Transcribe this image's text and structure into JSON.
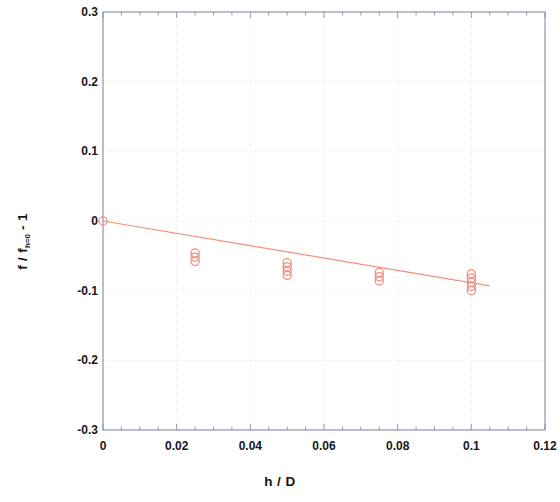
{
  "chart_data": {
    "type": "scatter",
    "title": "",
    "xlabel": "h / D",
    "ylabel_main": "f / f",
    "ylabel_sub": "h=0",
    "ylabel_tail": " - 1",
    "xlim": [
      0,
      0.12
    ],
    "ylim": [
      -0.3,
      0.3
    ],
    "xticks": [
      "0",
      "0.02",
      "0.04",
      "0.06",
      "0.08",
      "0.1",
      "0.12"
    ],
    "xtick_values": [
      0,
      0.02,
      0.04,
      0.06,
      0.08,
      0.1,
      0.12
    ],
    "yticks": [
      "0.3",
      "0.2",
      "0.1",
      "0",
      "-0.1",
      "-0.2",
      "-0.3"
    ],
    "ytick_values": [
      0.3,
      0.2,
      0.1,
      0,
      -0.1,
      -0.2,
      -0.3
    ],
    "x_minor_per_major": 4,
    "y_minor_per_major": 4,
    "grid": true,
    "grid_style": "dotted",
    "grid_color": "#e2e2ea",
    "axis_color": "#8a8ab0",
    "marker": "open-circle",
    "marker_color": "#f0907e",
    "line_color": "#f0907e",
    "legend": "none",
    "series": [
      {
        "name": "measured data",
        "type": "scatter",
        "marker": "open-circle",
        "points": [
          {
            "x": 0.0,
            "y": 0.0
          },
          {
            "x": 0.025,
            "y": -0.046
          },
          {
            "x": 0.025,
            "y": -0.052
          },
          {
            "x": 0.025,
            "y": -0.058
          },
          {
            "x": 0.05,
            "y": -0.06
          },
          {
            "x": 0.05,
            "y": -0.066
          },
          {
            "x": 0.05,
            "y": -0.072
          },
          {
            "x": 0.05,
            "y": -0.078
          },
          {
            "x": 0.075,
            "y": -0.074
          },
          {
            "x": 0.075,
            "y": -0.08
          },
          {
            "x": 0.075,
            "y": -0.086
          },
          {
            "x": 0.1,
            "y": -0.076
          },
          {
            "x": 0.1,
            "y": -0.082
          },
          {
            "x": 0.1,
            "y": -0.088
          },
          {
            "x": 0.1,
            "y": -0.094
          },
          {
            "x": 0.1,
            "y": -0.1
          }
        ]
      },
      {
        "name": "fit line",
        "type": "line",
        "points": [
          {
            "x": 0.0,
            "y": 0.0
          },
          {
            "x": 0.105,
            "y": -0.093
          }
        ]
      }
    ]
  },
  "axes": {
    "x_label_text": "h / D",
    "y_label_text": "f / f h=0 - 1"
  }
}
